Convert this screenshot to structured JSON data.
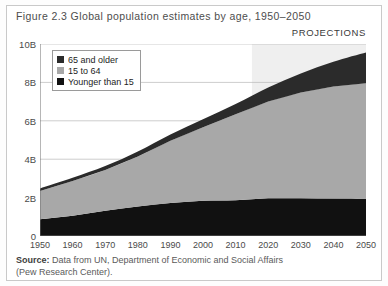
{
  "figure": {
    "title": "Figure 2.3 Global population estimates by age, 1950–2050",
    "projections_label": "PROJECTIONS",
    "source_lead": "Source:",
    "source_text": " Data from UN, Department of Economic and Social Affairs",
    "source_line2": "(Pew Research Center)."
  },
  "colors": {
    "older": "#2b2b2b",
    "working": "#a8a8a8",
    "younger": "#111111",
    "grid": "#b8b8b8",
    "axis": "#6e6e6e",
    "projection_band": "#efefef",
    "frame": "#c9c9c9"
  },
  "legend": {
    "items": [
      {
        "label": "65 and older",
        "color": "#2b2b2b"
      },
      {
        "label": "15 to 64",
        "color": "#a8a8a8"
      },
      {
        "label": "Younger than 15",
        "color": "#111111"
      }
    ]
  },
  "chart_data": {
    "type": "area",
    "title": "Figure 2.3 Global population estimates by age, 1950–2050",
    "xlabel": "",
    "ylabel": "",
    "stacked": true,
    "grid": true,
    "legend_position": "top-left",
    "xlim": [
      1950,
      2050
    ],
    "ylim": [
      0,
      10
    ],
    "yunit": "B",
    "ytick_labels": [
      "0",
      "2B",
      "4B",
      "6B",
      "8B",
      "10B"
    ],
    "ytick_values": [
      0,
      2,
      4,
      6,
      8,
      10
    ],
    "xtick_labels": [
      "1950",
      "1960",
      "1970",
      "1980",
      "1990",
      "2000",
      "2010",
      "2020",
      "2030",
      "2040",
      "2050"
    ],
    "x": [
      1950,
      1960,
      1970,
      1980,
      1990,
      2000,
      2010,
      2020,
      2030,
      2040,
      2050
    ],
    "series": [
      {
        "name": "Younger than 15",
        "color": "#111111",
        "values": [
          0.87,
          1.06,
          1.31,
          1.54,
          1.72,
          1.83,
          1.86,
          1.96,
          1.97,
          1.95,
          1.94
        ]
      },
      {
        "name": "15 to 64",
        "color": "#a8a8a8",
        "values": [
          1.48,
          1.81,
          2.13,
          2.6,
          3.24,
          3.83,
          4.48,
          5.04,
          5.5,
          5.84,
          6.02
        ]
      },
      {
        "name": "65 and older",
        "color": "#2b2b2b",
        "values": [
          0.13,
          0.16,
          0.2,
          0.26,
          0.33,
          0.42,
          0.53,
          0.73,
          1.0,
          1.29,
          1.6
        ]
      }
    ],
    "totals": [
      2.48,
      3.03,
      3.64,
      4.4,
      5.29,
      6.08,
      6.87,
      7.73,
      8.47,
      9.08,
      9.56
    ],
    "annotations": [
      {
        "text": "PROJECTIONS",
        "x_start": 2015,
        "x_end": 2050,
        "shaded": true
      }
    ]
  }
}
